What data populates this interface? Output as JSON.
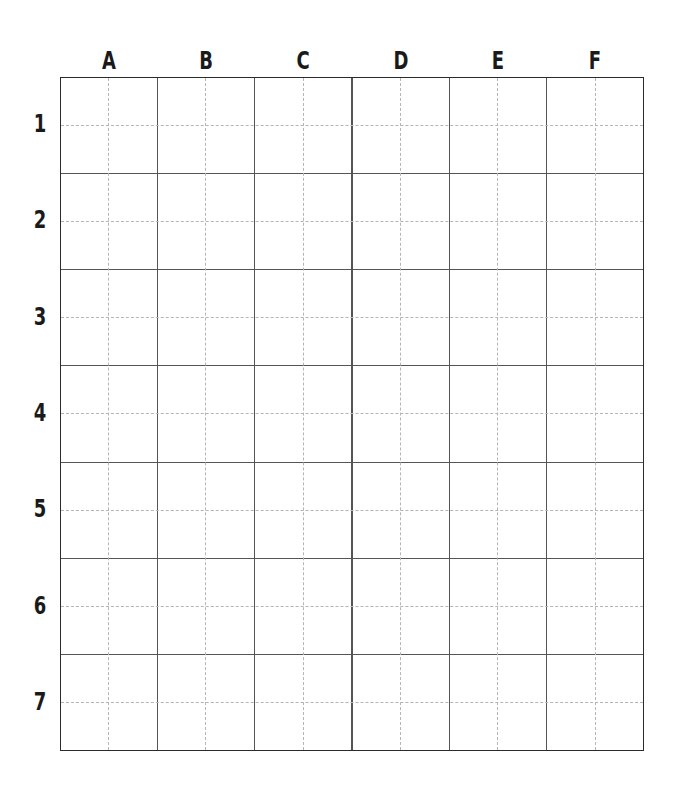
{
  "worksheet": {
    "type": "coordinate-grid",
    "columns": [
      {
        "label": "A"
      },
      {
        "label": "B"
      },
      {
        "label": "C"
      },
      {
        "label": "D"
      },
      {
        "label": "E"
      },
      {
        "label": "F"
      }
    ],
    "rows": [
      {
        "label": "1"
      },
      {
        "label": "2"
      },
      {
        "label": "3"
      },
      {
        "label": "4"
      },
      {
        "label": "5"
      },
      {
        "label": "6"
      },
      {
        "label": "7"
      }
    ],
    "colors": {
      "border": "#2b2b2b",
      "cell_line": "#555555",
      "guide_dash": "#b5b5b5",
      "label_text": "#1a1a1a",
      "background": "#ffffff"
    }
  }
}
